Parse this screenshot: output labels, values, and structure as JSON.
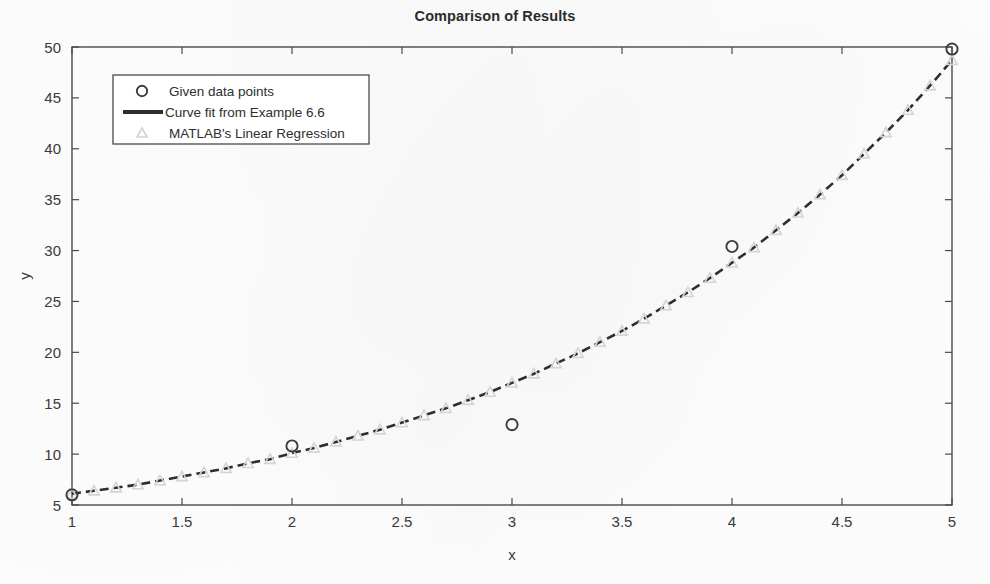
{
  "figure": {
    "title": "Comparison of Results",
    "background_color": "#fefefe",
    "axes_color": "#4a4a4a"
  },
  "chart_data": {
    "type": "scatter",
    "title": "Comparison of Results",
    "xlabel": "x",
    "ylabel": "y",
    "xlim": [
      1,
      5
    ],
    "ylim": [
      5,
      50
    ],
    "xticks": [
      "1",
      "1.5",
      "2",
      "2.5",
      "3",
      "3.5",
      "4",
      "4.5",
      "5"
    ],
    "xtick_values": [
      1,
      1.5,
      2,
      2.5,
      3,
      3.5,
      4,
      4.5,
      5
    ],
    "yticks": [
      "5",
      "10",
      "15",
      "20",
      "25",
      "30",
      "35",
      "40",
      "45",
      "50"
    ],
    "ytick_values": [
      5,
      10,
      15,
      20,
      25,
      30,
      35,
      40,
      45,
      50
    ],
    "grid": false,
    "legend_position": "upper left",
    "series": [
      {
        "name": "Given data points",
        "marker": "circle",
        "color": "#3c3c3c",
        "linestyle": "none",
        "x": [
          1,
          2,
          3,
          4,
          5
        ],
        "values": [
          6.0,
          10.8,
          12.9,
          30.4,
          49.8
        ]
      },
      {
        "name": "Curve fit from Example 6.6",
        "marker": "none",
        "color": "#2e2e2e",
        "linestyle": "dashed",
        "x": [
          1,
          1.1,
          1.2,
          1.3,
          1.4,
          1.5,
          1.6,
          1.7,
          1.8,
          1.9,
          2,
          2.1,
          2.2,
          2.3,
          2.4,
          2.5,
          2.6,
          2.7,
          2.8,
          2.9,
          3,
          3.1,
          3.2,
          3.3,
          3.4,
          3.5,
          3.6,
          3.7,
          3.8,
          3.9,
          4,
          4.1,
          4.2,
          4.3,
          4.4,
          4.5,
          4.6,
          4.7,
          4.8,
          4.9,
          5
        ],
        "values": [
          6.1,
          6.4,
          6.7,
          7.0,
          7.4,
          7.8,
          8.2,
          8.6,
          9.1,
          9.5,
          10.1,
          10.6,
          11.2,
          11.8,
          12.4,
          13.1,
          13.8,
          14.5,
          15.3,
          16.1,
          17.0,
          17.9,
          18.9,
          19.9,
          21.0,
          22.1,
          23.3,
          24.6,
          25.9,
          27.3,
          28.8,
          30.3,
          32.0,
          33.7,
          35.5,
          37.4,
          39.5,
          41.6,
          43.8,
          46.2,
          48.7
        ]
      },
      {
        "name": "MATLAB's Linear Regression",
        "marker": "triangle",
        "color": "#d4d4d4",
        "linestyle": "none",
        "x": [
          1,
          1.1,
          1.2,
          1.3,
          1.4,
          1.5,
          1.6,
          1.7,
          1.8,
          1.9,
          2,
          2.1,
          2.2,
          2.3,
          2.4,
          2.5,
          2.6,
          2.7,
          2.8,
          2.9,
          3,
          3.1,
          3.2,
          3.3,
          3.4,
          3.5,
          3.6,
          3.7,
          3.8,
          3.9,
          4,
          4.1,
          4.2,
          4.3,
          4.4,
          4.5,
          4.6,
          4.7,
          4.8,
          4.9,
          5
        ],
        "values": [
          6.1,
          6.4,
          6.7,
          7.0,
          7.4,
          7.8,
          8.2,
          8.6,
          9.1,
          9.5,
          10.1,
          10.6,
          11.2,
          11.8,
          12.4,
          13.1,
          13.8,
          14.5,
          15.3,
          16.1,
          17.0,
          17.9,
          18.9,
          19.9,
          21.0,
          22.1,
          23.3,
          24.6,
          25.9,
          27.3,
          28.8,
          30.3,
          32.0,
          33.7,
          35.5,
          37.4,
          39.5,
          41.6,
          43.8,
          46.2,
          48.7
        ]
      }
    ],
    "legend": [
      "Given data points",
      "Curve fit from Example 6.6",
      "MATLAB's Linear Regression"
    ]
  }
}
